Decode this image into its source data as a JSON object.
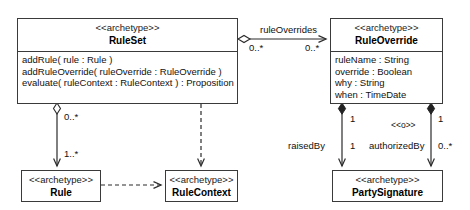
{
  "diagram": {
    "type": "uml-class-diagram",
    "stereotype_label": "<<archetype>>",
    "classes": [
      {
        "id": "ruleset",
        "stereotype": "<<archetype>>",
        "name": "RuleSet",
        "members": [
          "addRule( rule : Rule )",
          "addRuleOverride( ruleOverride : RuleOverride )",
          "evaluate( ruleContext : RuleContext ) : Proposition"
        ]
      },
      {
        "id": "ruleoverride",
        "stereotype": "<<archetype>>",
        "name": "RuleOverride",
        "members": [
          "ruleName : String",
          "override : Boolean",
          "why : String",
          "when : TimeDate"
        ]
      },
      {
        "id": "rule",
        "stereotype": "<<archetype>>",
        "name": "Rule",
        "members": []
      },
      {
        "id": "rulecontext",
        "stereotype": "<<archetype>>",
        "name": "RuleContext",
        "members": []
      },
      {
        "id": "partysignature",
        "stereotype": "<<archetype>>",
        "name": "PartySignature",
        "members": []
      }
    ],
    "edge_labels": {
      "rule_overrides_name": "ruleOverrides",
      "ruleset_to_override_source_mult": "0..*",
      "ruleset_to_override_target_mult": "0..*",
      "ruleset_to_rule_source_mult": "0..*",
      "ruleset_to_rule_target_mult": "1..*",
      "raised_by_name": "raisedBy",
      "raised_by_source_mult": "1",
      "raised_by_target_mult": "1",
      "authorized_by_name": "authorizedBy",
      "authorized_by_stereotype": "<<o>>",
      "authorized_by_source_mult": "1",
      "authorized_by_target_mult": "0..*"
    },
    "colors": {
      "stroke": "#3a3a3a",
      "fill": "#ffffff",
      "text": "#111111"
    }
  }
}
